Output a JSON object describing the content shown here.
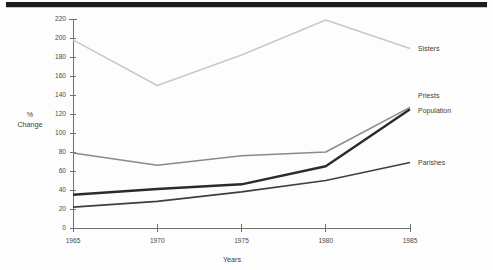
{
  "chart_data": {
    "type": "line",
    "title": "",
    "xlabel": "Years",
    "ylabel": "% Change",
    "ylabel_line1": "%",
    "ylabel_line2": "Change",
    "x": [
      1965,
      1970,
      1975,
      1980,
      1985
    ],
    "categories": [
      "1965",
      "1970",
      "1975",
      "1980",
      "1985"
    ],
    "xlim": [
      1965,
      1985
    ],
    "ylim": [
      0,
      220
    ],
    "yticks": [
      0,
      20,
      40,
      60,
      80,
      100,
      120,
      140,
      160,
      180,
      200,
      220
    ],
    "ytick_labels": [
      "0",
      "20",
      "40",
      "60",
      "80",
      "100",
      "120",
      "140",
      "160",
      "180",
      "200",
      "220"
    ],
    "grid": false,
    "legend_position": "right-inline-labels",
    "series": [
      {
        "name": "Sisters",
        "label": "Sisters",
        "color": "#c9c9c9",
        "width": 1.6,
        "values": [
          198,
          150,
          182,
          219,
          189
        ],
        "label_y": 189
      },
      {
        "name": "Priests",
        "label": "Priests",
        "color": "#2b2b2b",
        "width": 2.4,
        "values": [
          35,
          41,
          46,
          65,
          125
        ],
        "label_y": 139
      },
      {
        "name": "Population",
        "label": "Population",
        "color": "#8a8a8a",
        "width": 1.5,
        "values": [
          79,
          66,
          76,
          80,
          127
        ],
        "label_y": 124
      },
      {
        "name": "Parishes",
        "label": "Parishes",
        "color": "#3f3f3f",
        "width": 1.6,
        "values": [
          22,
          28,
          38,
          50,
          69
        ],
        "label_y": 69
      }
    ]
  },
  "page": {
    "rule_color": "#1c1c1c",
    "background": "#fdfdfd"
  }
}
